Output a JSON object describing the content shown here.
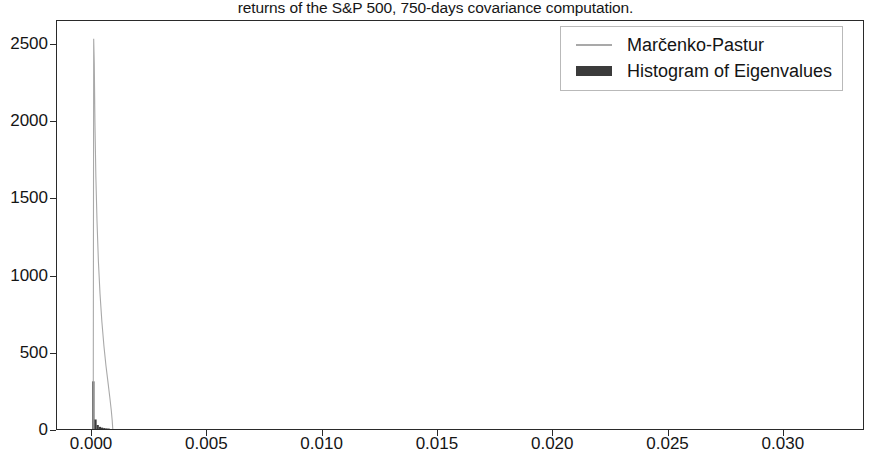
{
  "figure": {
    "title": "returns of the S&P 500, 750-days covariance computation.",
    "background": "#ffffff",
    "axis_color": "#2a2a2a"
  },
  "legend": {
    "position": "upper right",
    "entries": [
      {
        "label": "Marčenko-Pastur",
        "marker": "line",
        "color": "#a9a9a9"
      },
      {
        "label": "Histogram of Eigenvalues",
        "marker": "bar",
        "color": "#3b3b3b"
      }
    ]
  },
  "axes": {
    "x_ticks": [
      "0.000",
      "0.005",
      "0.010",
      "0.015",
      "0.020",
      "0.025",
      "0.030"
    ],
    "x_tick_values": [
      0.0,
      0.005,
      0.01,
      0.015,
      0.02,
      0.025,
      0.03
    ],
    "y_ticks": [
      "0",
      "500",
      "1000",
      "1500",
      "2000",
      "2500"
    ],
    "y_tick_values": [
      0,
      500,
      1000,
      1500,
      2000,
      2500
    ]
  },
  "chart_data": {
    "type": "line",
    "title": "returns of the S&P 500, 750-days covariance computation.",
    "xlabel": "",
    "ylabel": "",
    "xlim": [
      -0.00152,
      0.03352
    ],
    "ylim": [
      0,
      2655
    ],
    "grid": false,
    "legend_position": "upper right",
    "series": [
      {
        "name": "Marčenko-Pastur",
        "type": "line",
        "color": "#a9a9a9",
        "linewidth": 1.1,
        "x": [
          5.5e-05,
          7.5e-05,
          0.0001,
          0.00013,
          0.00017,
          0.00022,
          0.00028,
          0.00035,
          0.00043,
          0.00052,
          0.00061,
          0.0007,
          0.00078,
          0.00084,
          0.00088,
          0.000905
        ],
        "y": [
          0,
          2540,
          2380,
          1990,
          1640,
          1350,
          1090,
          880,
          700,
          540,
          410,
          300,
          200,
          120,
          55,
          0
        ]
      },
      {
        "name": "Histogram of Eigenvalues",
        "type": "bar",
        "color": "#3b3b3b",
        "bar_width": 9.5e-05,
        "x": [
          6e-05,
          0.000155,
          0.00025,
          0.000345,
          0.00044,
          0.000535,
          0.00063,
          0.000725
        ],
        "y": [
          310,
          62,
          26,
          14,
          9,
          6,
          4,
          3
        ]
      }
    ]
  }
}
